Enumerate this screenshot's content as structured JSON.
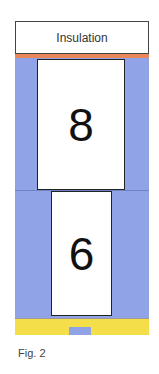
{
  "figure": {
    "caption": "Fig. 2",
    "top_label": "Insulation",
    "upper_block": {
      "label": "8"
    },
    "lower_block": {
      "label": "6"
    },
    "colors": {
      "insulation": "#ffffff",
      "orange_strip": "#e8875a",
      "body_fill": "#8fa3e6",
      "bottom_strip": "#f4de4a",
      "bottom_tab": "#8fa3e6",
      "block_fill": "#ffffff",
      "block_border": "#222222"
    }
  }
}
